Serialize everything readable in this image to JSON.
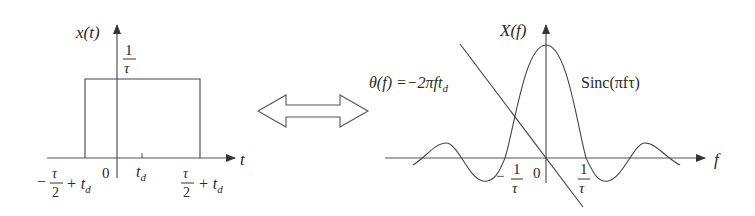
{
  "left_plot": {
    "y_label": "x(t)",
    "x_label": "t",
    "amplitude_num": "1",
    "amplitude_den": "τ",
    "origin_label": "0",
    "delay_label": "t",
    "delay_sub": "d",
    "left_edge": {
      "sign": "−",
      "num": "τ",
      "den": "2",
      "plus": "+ t",
      "sub": "d"
    },
    "right_edge": {
      "num": "τ",
      "den": "2",
      "plus": "+ t",
      "sub": "d"
    }
  },
  "arrow": {
    "meaning": "Fourier transform pair"
  },
  "right_plot": {
    "y_label": "X(f)",
    "x_label": "f",
    "phase_label": "θ(f) =−2πft",
    "phase_sub": "d",
    "magnitude_label": "Sinc(πfτ)",
    "origin_label": "0",
    "neg_zero": {
      "sign": "−",
      "num": "1",
      "den": "τ"
    },
    "pos_zero": {
      "num": "1",
      "den": "τ"
    }
  },
  "colors": {
    "line": "#3a3a3a",
    "text": "#2a2a2a",
    "background": "#ffffff"
  }
}
